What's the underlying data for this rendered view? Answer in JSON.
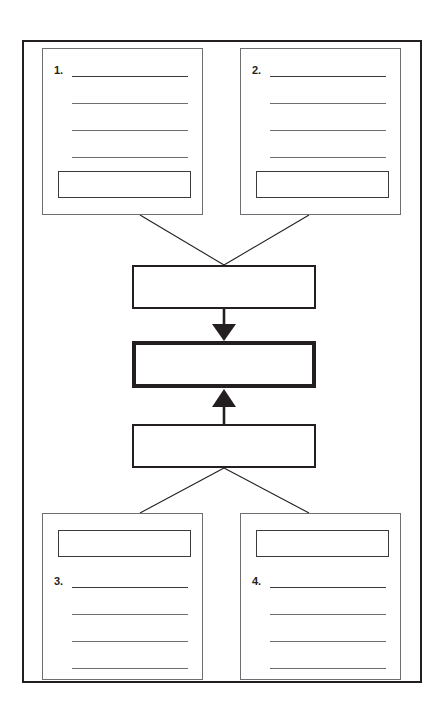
{
  "diagram": {
    "colors": {
      "frame_stroke": "#231f20",
      "card_stroke": "#6d6e71",
      "rule_stroke": "#3b3b3d",
      "box_stroke": "#231f20",
      "background": "#ffffff"
    },
    "outer_frame": {
      "name": "page-border"
    },
    "cards": [
      {
        "id": "card-1",
        "position": "top-left",
        "number_label": "1.",
        "has_number": true,
        "number_on_line": 1,
        "answer_box_position": "bottom",
        "answer_box_value": "",
        "rule_count": 4,
        "rules": [
          "",
          "",
          "",
          ""
        ]
      },
      {
        "id": "card-2",
        "position": "top-right",
        "number_label": "2.",
        "has_number": true,
        "number_on_line": 1,
        "answer_box_position": "bottom",
        "answer_box_value": "",
        "rule_count": 4,
        "rules": [
          "",
          "",
          "",
          ""
        ]
      },
      {
        "id": "card-3",
        "position": "bottom-left",
        "number_label": "3.",
        "has_number": true,
        "number_on_line": 1,
        "answer_box_position": "top",
        "answer_box_value": "",
        "rule_count": 4,
        "rules": [
          "",
          "",
          "",
          ""
        ]
      },
      {
        "id": "card-4",
        "position": "bottom-right",
        "number_label": "4.",
        "has_number": true,
        "number_on_line": 1,
        "answer_box_position": "top",
        "answer_box_value": "",
        "rule_count": 4,
        "rules": [
          "",
          "",
          "",
          ""
        ]
      }
    ],
    "center_boxes": [
      {
        "id": "center-box-top",
        "value": "",
        "emphasis": "normal"
      },
      {
        "id": "center-box-middle",
        "value": "",
        "emphasis": "bold"
      },
      {
        "id": "center-box-bottom",
        "value": "",
        "emphasis": "normal"
      }
    ],
    "arrows": [
      {
        "id": "arrow-down",
        "from": "center-box-top",
        "to": "center-box-middle",
        "direction": "down",
        "style": "solid-filled-head"
      },
      {
        "id": "arrow-up",
        "from": "center-box-bottom",
        "to": "center-box-middle",
        "direction": "up",
        "style": "solid-filled-head"
      }
    ],
    "connector_lines": [
      {
        "id": "connector-card1",
        "from": "card-1",
        "to": "center-box-top"
      },
      {
        "id": "connector-card2",
        "from": "card-2",
        "to": "center-box-top"
      },
      {
        "id": "connector-card3",
        "from": "center-box-bottom",
        "to": "card-3"
      },
      {
        "id": "connector-card4",
        "from": "center-box-bottom",
        "to": "card-4"
      }
    ]
  }
}
